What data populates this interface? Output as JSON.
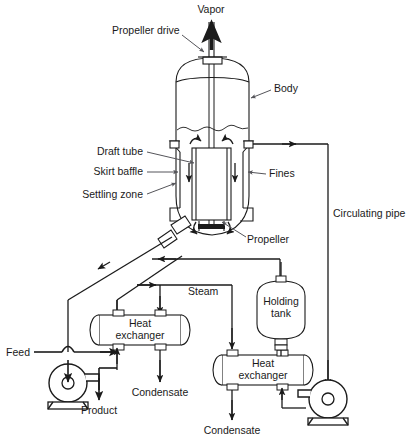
{
  "diagram": {
    "stroke_color": "#1b1b1b",
    "leader_color": "#55555a",
    "fill_color": "#ffffff",
    "labels": {
      "vapor": "Vapor",
      "propeller_drive": "Propeller drive",
      "body": "Body",
      "draft_tube": "Draft tube",
      "skirt_baffle": "Skirt baffle",
      "settling_zone": "Settling zone",
      "fines": "Fines",
      "propeller": "Propeller",
      "circulating_pipe": "Circulating pipe",
      "steam": "Steam",
      "heat_exchanger_1_line1": "Heat",
      "heat_exchanger_1_line2": "exchanger",
      "heat_exchanger_2_line1": "Heat",
      "heat_exchanger_2_line2": "exchanger",
      "holding_tank_line1": "Holding",
      "holding_tank_line2": "tank",
      "feed": "Feed",
      "product": "Product",
      "condensate_left": "Condensate",
      "condensate_right": "Condensate"
    },
    "equipment": [
      {
        "name": "crystallizer-body",
        "label": "Body"
      },
      {
        "name": "draft-tube",
        "label": "Draft tube"
      },
      {
        "name": "skirt-baffle",
        "label": "Skirt baffle"
      },
      {
        "name": "settling-zone",
        "label": "Settling zone"
      },
      {
        "name": "propeller",
        "label": "Propeller"
      },
      {
        "name": "propeller-drive",
        "label": "Propeller drive"
      },
      {
        "name": "heat-exchanger-1",
        "label": "Heat exchanger"
      },
      {
        "name": "heat-exchanger-2",
        "label": "Heat exchanger"
      },
      {
        "name": "holding-tank",
        "label": "Holding tank"
      },
      {
        "name": "pump-left",
        "label": "Pump"
      },
      {
        "name": "pump-right",
        "label": "Pump"
      }
    ],
    "streams": [
      {
        "name": "vapor-outlet",
        "label": "Vapor",
        "direction": "up"
      },
      {
        "name": "fines-offtake",
        "label": "Fines",
        "direction": "right"
      },
      {
        "name": "circulating-pipe",
        "label": "Circulating pipe",
        "direction": "down"
      },
      {
        "name": "steam-header",
        "label": "Steam",
        "direction": "right"
      },
      {
        "name": "feed-inlet",
        "label": "Feed",
        "direction": "right"
      },
      {
        "name": "product-outlet",
        "label": "Product",
        "direction": "down"
      },
      {
        "name": "condensate-outlet-1",
        "label": "Condensate",
        "direction": "down"
      },
      {
        "name": "condensate-outlet-2",
        "label": "Condensate",
        "direction": "down"
      }
    ]
  }
}
